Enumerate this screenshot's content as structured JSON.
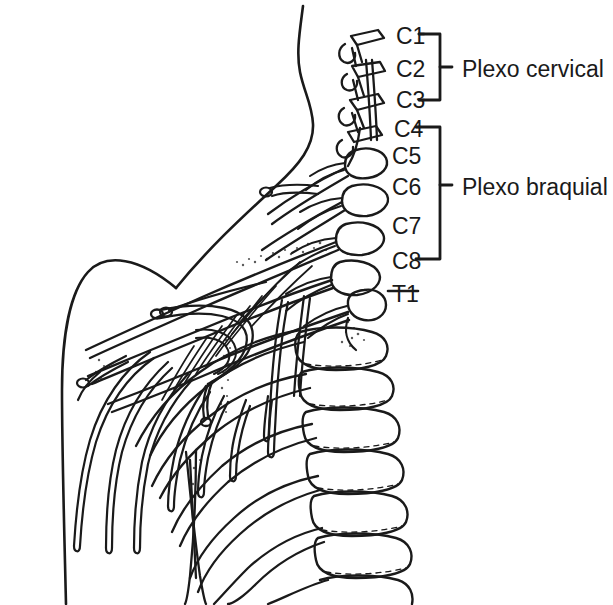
{
  "figure": {
    "kind": "anatomical-line-drawing",
    "language": "pt",
    "ink_color": "#1a1a1a",
    "background_color": "#ffffff"
  },
  "root_labels": [
    {
      "id": "c1",
      "text": "C1",
      "x": 396,
      "y": 25
    },
    {
      "id": "c2",
      "text": "C2",
      "x": 396,
      "y": 58
    },
    {
      "id": "c3",
      "text": "C3",
      "x": 396,
      "y": 89
    },
    {
      "id": "c4",
      "text": "C4",
      "x": 394,
      "y": 118
    },
    {
      "id": "c5",
      "text": "C5",
      "x": 392,
      "y": 145
    },
    {
      "id": "c6",
      "text": "C6",
      "x": 392,
      "y": 176
    },
    {
      "id": "c7",
      "text": "C7",
      "x": 392,
      "y": 215
    },
    {
      "id": "c8",
      "text": "C8",
      "x": 392,
      "y": 250
    },
    {
      "id": "t1",
      "text": "T1",
      "x": 392,
      "y": 283
    }
  ],
  "group_labels": [
    {
      "id": "cervical",
      "text": "Plexo cervical",
      "x": 462,
      "y": 58
    },
    {
      "id": "brachial",
      "text": "Plexo braquial",
      "x": 462,
      "y": 176
    }
  ],
  "brackets": [
    {
      "id": "cervical-bracket",
      "top": 34,
      "bottom": 100,
      "x": 440,
      "tick_y": 67
    },
    {
      "id": "brachial-bracket",
      "top": 127,
      "bottom": 259,
      "x": 440,
      "tick_y": 185
    }
  ]
}
